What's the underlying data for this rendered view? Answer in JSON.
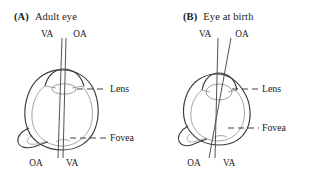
{
  "figure": {
    "panels": [
      {
        "id": "a",
        "letter": "(A)",
        "title": "Adult eye",
        "top_labels": {
          "left": "VA",
          "right": "OA"
        },
        "bottom_labels": {
          "left": "OA",
          "right": "VA"
        },
        "part_labels": {
          "lens": "Lens",
          "fovea": "Fovea"
        }
      },
      {
        "id": "b",
        "letter": "(B)",
        "title": "Eye at birth",
        "top_labels": {
          "left": "VA",
          "right": "OA"
        },
        "bottom_labels": {
          "left": "OA",
          "right": "VA"
        },
        "part_labels": {
          "lens": "Lens",
          "fovea": "Fovea"
        }
      }
    ],
    "colors": {
      "ink": "#1a1a1a",
      "outline": "#3a3a3a",
      "interior": "#8d8d8d",
      "axis_line": "#4a4a4a",
      "leader": "#2b2b2b",
      "background": "#ffffff"
    }
  }
}
